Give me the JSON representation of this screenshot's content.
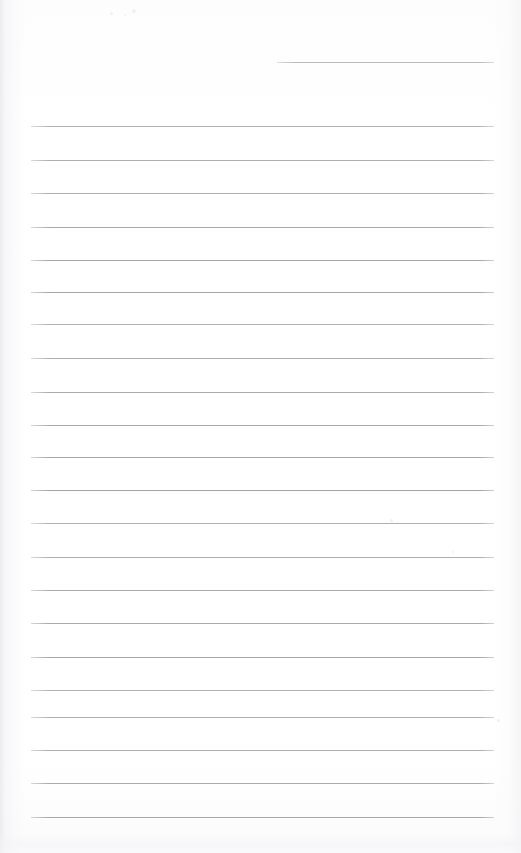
{
  "document": {
    "kind": "scanned-lined-notepaper",
    "title": "Lined notepaper page",
    "page_width": 521,
    "page_height": 853,
    "background_color": "#ffffff",
    "rule_color": "#a0a0a5",
    "header_rule_color": "#b4b4b9",
    "content_text": "",
    "handwriting_present": "no",
    "notes": "Blank ruled page; no written or printed text content is visible."
  },
  "header_rule": {
    "name": "header-rule",
    "x": 277,
    "y": 62,
    "width": 217
  },
  "rules_geometry": {
    "left_x": 31,
    "right_x": 494,
    "width": 463,
    "first_y": 126,
    "spacing": 33.2,
    "count": 22
  },
  "rules": [
    {
      "y": 126
    },
    {
      "y": 160
    },
    {
      "y": 193
    },
    {
      "y": 227
    },
    {
      "y": 260
    },
    {
      "y": 292
    },
    {
      "y": 324
    },
    {
      "y": 358
    },
    {
      "y": 392
    },
    {
      "y": 425
    },
    {
      "y": 457
    },
    {
      "y": 490
    },
    {
      "y": 523
    },
    {
      "y": 557
    },
    {
      "y": 590
    },
    {
      "y": 623
    },
    {
      "y": 657
    },
    {
      "y": 690
    },
    {
      "y": 717
    },
    {
      "y": 750
    },
    {
      "y": 783
    },
    {
      "y": 817
    }
  ],
  "artifacts": {
    "left_edge_shadow": "true",
    "right_edge_shadow": "true",
    "bottom_smudge": "true",
    "specks": [
      {
        "x": 110,
        "y": 12,
        "size": 3
      },
      {
        "x": 124,
        "y": 14,
        "size": 2
      },
      {
        "x": 132,
        "y": 9,
        "size": 4
      },
      {
        "x": 390,
        "y": 519,
        "size": 3
      },
      {
        "x": 452,
        "y": 551,
        "size": 2
      },
      {
        "x": 497,
        "y": 719,
        "size": 3
      }
    ]
  }
}
